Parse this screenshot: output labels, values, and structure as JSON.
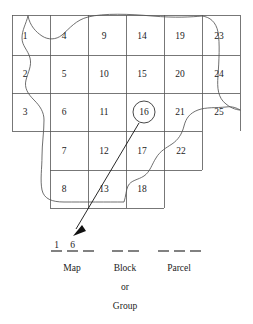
{
  "figure": {
    "title_partial": "",
    "grid": {
      "columns": 6,
      "rows": 5,
      "cell_numbers_by_row": [
        [
          "1",
          "4",
          "9",
          "14",
          "19",
          "23"
        ],
        [
          "2",
          "5",
          "10",
          "15",
          "20",
          "24"
        ],
        [
          "3",
          "6",
          "11",
          "16",
          "21",
          "25"
        ],
        [
          "",
          "7",
          "12",
          "17",
          "22",
          ""
        ],
        [
          "",
          "8",
          "13",
          "18",
          "",
          ""
        ]
      ],
      "highlighted_cell": "16",
      "highlight_style": "circled",
      "line_color": "#555555",
      "text_color": "#1b1b1b"
    },
    "boundary": {
      "name": "irregular-parcel-boundary",
      "color": "#555555"
    },
    "leader": {
      "name": "leader-arrow",
      "from_cell": "16",
      "points_to": "map-blank-1",
      "color": "#111111"
    },
    "identifier": {
      "groups": [
        {
          "label": "Map",
          "blanks": 3,
          "values": [
            "1",
            "6",
            ""
          ]
        },
        {
          "label": "Block",
          "sublabel_line1": "or",
          "sublabel_line2": "Group",
          "blanks": 2,
          "values": [
            "",
            ""
          ]
        },
        {
          "label": "Parcel",
          "blanks": 3,
          "values": [
            "",
            "",
            ""
          ]
        }
      ]
    },
    "captions": {
      "map": "Map",
      "block": "Block",
      "parcel": "Parcel",
      "or": "or",
      "group": "Group"
    }
  }
}
